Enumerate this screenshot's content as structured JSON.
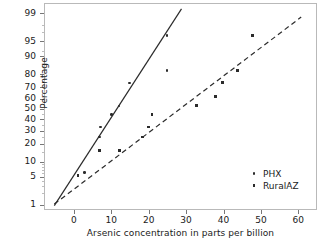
{
  "chart_data": {
    "type": "scatter",
    "title": "",
    "xlabel": "Arsenic concentration in parts per billion",
    "ylabel": "Percentage",
    "xlim": [
      -8,
      65
    ],
    "ylim_percent": [
      0.7,
      99.5
    ],
    "yscale": "normal probability",
    "grid": false,
    "legend_position": "lower right",
    "xticks": [
      0,
      10,
      20,
      30,
      40,
      50,
      60
    ],
    "yticks": [
      1,
      5,
      10,
      20,
      30,
      40,
      50,
      60,
      70,
      80,
      90,
      95,
      99
    ],
    "series": [
      {
        "name": "PHX",
        "marker": "dot",
        "fit_line": "solid",
        "points": [
          {
            "x": 0.8,
            "y": 5.5
          },
          {
            "x": 2.6,
            "y": 6.4
          },
          {
            "x": 6.6,
            "y": 25.5
          },
          {
            "x": 6.8,
            "y": 34.0
          },
          {
            "x": 9.8,
            "y": 45.5
          },
          {
            "x": 11.8,
            "y": 54.0
          },
          {
            "x": 14.6,
            "y": 74.5
          },
          {
            "x": 24.6,
            "y": 96.5
          },
          {
            "x": 24.6,
            "y": 83.0
          }
        ],
        "fit_endpoints": [
          {
            "x": -5.5,
            "y": 1.0
          },
          {
            "x": 28.5,
            "y": 99.3
          }
        ]
      },
      {
        "name": "RuralAZ",
        "marker": "square",
        "fit_line": "dashed",
        "points": [
          {
            "x": 0.8,
            "y": 5.6
          },
          {
            "x": 6.5,
            "y": 16.2
          },
          {
            "x": 11.9,
            "y": 16.0
          },
          {
            "x": 18.0,
            "y": 25.5
          },
          {
            "x": 19.6,
            "y": 34.0
          },
          {
            "x": 20.6,
            "y": 45.5
          },
          {
            "x": 32.6,
            "y": 54.0
          },
          {
            "x": 37.6,
            "y": 63.0
          },
          {
            "x": 39.4,
            "y": 74.5
          },
          {
            "x": 43.5,
            "y": 83.0
          },
          {
            "x": 47.4,
            "y": 96.5
          }
        ],
        "fit_endpoints": [
          {
            "x": -5.5,
            "y": 1.1
          },
          {
            "x": 60.5,
            "y": 98.8
          }
        ]
      }
    ]
  },
  "axis": {
    "y_title": "Percentage",
    "x_title": "Arsenic concentration in parts per billion",
    "y_tick_labels": [
      "99",
      "95",
      "90",
      "80",
      "70",
      "60",
      "50",
      "40",
      "30",
      "20",
      "10",
      "5",
      "1"
    ],
    "x_tick_labels": [
      "0",
      "10",
      "20",
      "30",
      "40",
      "50",
      "60"
    ]
  },
  "legend": {
    "items": [
      {
        "label": "PHX",
        "marker": "dot-marker"
      },
      {
        "label": "RuralAZ",
        "marker": "square-marker"
      }
    ]
  },
  "colors": {
    "ink": "#2b2b2b",
    "frame": "#b9b9b9",
    "text": "#1a1a1a"
  }
}
